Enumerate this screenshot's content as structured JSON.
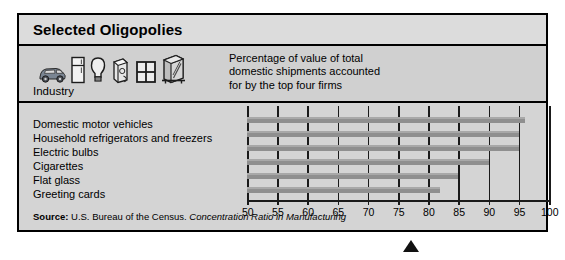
{
  "figure": {
    "title": "Selected Oligopolies",
    "industry_label": "Industry",
    "caption": "Percentage of value of total\ndomestic shipments accounted\nfor by the top four firms",
    "source_prefix": "Source:",
    "source_text": "U.S. Bureau of the Census.",
    "source_italic": "Concentration Ratio in Manufacturing"
  },
  "icons": [
    {
      "name": "car-icon"
    },
    {
      "name": "refrigerator-icon"
    },
    {
      "name": "light-bulb-icon"
    },
    {
      "name": "cigarette-pack-icon"
    },
    {
      "name": "window-pane-icon"
    },
    {
      "name": "greeting-card-icon"
    }
  ],
  "colors": {
    "frame_border": "#000000",
    "title_band": "#dcdcdc",
    "head_band": "#d0d0d0",
    "plot_band": "#d4d4d4",
    "bar_fill": "#8f8f8f",
    "bar_top_highlight": "#a8a8a8",
    "gridline": "#1a1a1a",
    "marker": "#111111"
  },
  "chart_data": {
    "type": "bar",
    "orientation": "horizontal",
    "title": "Selected Oligopolies",
    "xlabel": "Percentage of value of total domestic shipments accounted for by the top four firms",
    "ylabel": "Industry",
    "xlim": [
      50,
      100
    ],
    "xticks": [
      50,
      55,
      60,
      65,
      70,
      75,
      80,
      85,
      90,
      95,
      100
    ],
    "grid": true,
    "legend": false,
    "categories": [
      "Domestic motor vehicles",
      "Household refrigerators and freezers",
      "Electric bulbs",
      "Cigarettes",
      "Flat glass",
      "Greeting cards"
    ],
    "values": [
      96,
      95,
      95,
      90,
      85,
      82
    ]
  }
}
